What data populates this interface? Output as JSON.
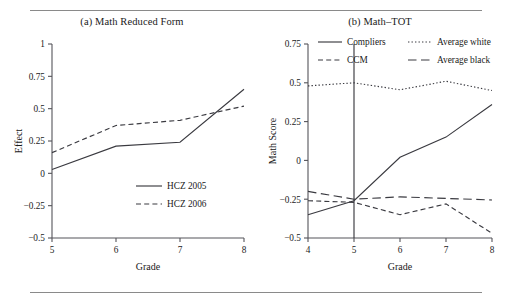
{
  "figure": {
    "panel_a_title": "(a) Math Reduced Form",
    "panel_b_title": "(b) Math–TOT"
  },
  "chart_data": [
    {
      "type": "line",
      "title": "(a) Math Reduced Form",
      "xlabel": "Grade",
      "ylabel": "Effect",
      "x": [
        5,
        6,
        7,
        8
      ],
      "xticklabels": [
        "5",
        "6",
        "7",
        "8"
      ],
      "xlim": [
        5,
        8
      ],
      "ylim": [
        -0.5,
        1
      ],
      "yticks": [
        -0.5,
        -0.25,
        0,
        0.25,
        0.5,
        0.75,
        1
      ],
      "yticklabels": [
        "−0.5",
        "−0.25",
        "0",
        "0.25",
        "0.5",
        "0.75",
        "1"
      ],
      "grid": false,
      "legend_position": "lower right",
      "series": [
        {
          "name": "HCZ 2005",
          "style": "solid",
          "values": [
            0.03,
            0.21,
            0.24,
            0.65
          ]
        },
        {
          "name": "HCZ 2006",
          "style": "dashed",
          "values": [
            0.16,
            0.37,
            0.41,
            0.52
          ]
        }
      ]
    },
    {
      "type": "line",
      "title": "(b) Math–TOT",
      "xlabel": "Grade",
      "ylabel": "Math Score",
      "x": [
        4,
        5,
        6,
        7,
        8
      ],
      "xticklabels": [
        "4",
        "5",
        "6",
        "7",
        "8"
      ],
      "xlim": [
        4,
        8
      ],
      "ylim": [
        -0.5,
        0.75
      ],
      "yticks": [
        -0.5,
        -0.25,
        0,
        0.25,
        0.5,
        0.75
      ],
      "yticklabels": [
        "−0.5",
        "−0.25",
        "0",
        "0.25",
        "0.5",
        "0.75"
      ],
      "grid": false,
      "legend_position": "upper center",
      "vertical_reference_line": {
        "x": 5
      },
      "series": [
        {
          "name": "Compliers",
          "style": "solid",
          "values": [
            -0.35,
            -0.26,
            0.02,
            0.15,
            0.36
          ]
        },
        {
          "name": "CCM",
          "style": "dashed",
          "values": [
            -0.26,
            -0.27,
            -0.35,
            -0.28,
            -0.47
          ]
        },
        {
          "name": "Average white",
          "style": "dotted",
          "values": [
            0.48,
            0.5,
            0.455,
            0.51,
            0.45
          ]
        },
        {
          "name": "Average black",
          "style": "long-dash",
          "values": [
            -0.2,
            -0.25,
            -0.235,
            -0.245,
            -0.255
          ]
        }
      ]
    }
  ]
}
